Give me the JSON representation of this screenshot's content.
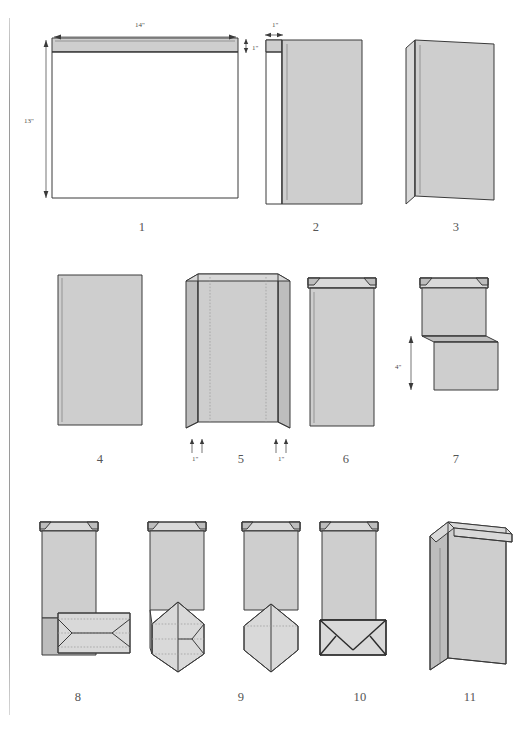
{
  "document": {
    "kind": "instructional-diagram",
    "subject": "Paper bag folding instructions",
    "step_count": 11
  },
  "steps": [
    {
      "number": "1",
      "name": "flat-sheet-with-glue-strip"
    },
    {
      "number": "2",
      "name": "sheet-folded-with-one-inch-margin"
    },
    {
      "number": "3",
      "name": "side-flap-closing"
    },
    {
      "number": "4",
      "name": "flat-tube"
    },
    {
      "number": "5",
      "name": "tube-with-side-gussets"
    },
    {
      "number": "6",
      "name": "gusseted-tube-top-view"
    },
    {
      "number": "7",
      "name": "bottom-folded-up-four-inches"
    },
    {
      "number": "8",
      "name": "base-panel-creased"
    },
    {
      "number": "9",
      "name": "base-opened-and-pointed"
    },
    {
      "number": "10",
      "name": "base-folded-closed"
    },
    {
      "number": "11",
      "name": "finished-bag"
    }
  ],
  "dimensions": {
    "sheet_width": "14\"",
    "sheet_height": "13\"",
    "top_strip": "1\"",
    "side_margin": "1\"",
    "gusset_left": "1\"",
    "gusset_right": "1\"",
    "bottom_fold": "4\""
  },
  "colors": {
    "paper_fill": "#cecece",
    "paper_light": "#d9d9d9",
    "paper_dark": "#bdbdbd",
    "outline": "#3a3a3a",
    "crease": "#9a9a9a",
    "background": "#ffffff",
    "caption": "#555555"
  }
}
